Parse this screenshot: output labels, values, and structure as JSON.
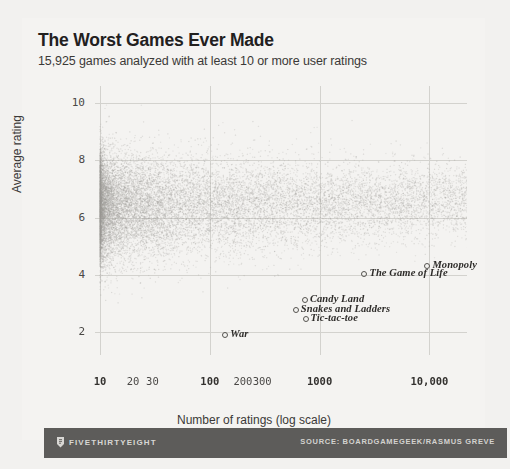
{
  "header": {
    "title": "The Worst Games Ever Made",
    "subtitle": "15,925 games analyzed with at least 10 or more user ratings"
  },
  "footer": {
    "brand": "FIVETHIRTYEIGHT",
    "source": "SOURCE: BOARDGAMEGEEK/RASMUS GREVE"
  },
  "chart_data": {
    "type": "scatter",
    "title": "The Worst Games Ever Made",
    "subtitle": "15,925 games analyzed with at least 10 or more user ratings",
    "xlabel": "Number of ratings (log scale)",
    "ylabel": "Average rating",
    "xscale": "log",
    "xlim": [
      9,
      22000
    ],
    "ylim": [
      1.2,
      10.6
    ],
    "grid": true,
    "legend": false,
    "point_count": 15925,
    "point_color": "#9a9894",
    "xticks": [
      {
        "value": 10,
        "label": "10",
        "major": true
      },
      {
        "value": 20,
        "label": "20",
        "major": false
      },
      {
        "value": 30,
        "label": "30",
        "major": false
      },
      {
        "value": 100,
        "label": "100",
        "major": true
      },
      {
        "value": 200,
        "label": "200",
        "major": false
      },
      {
        "value": 300,
        "label": "300",
        "major": false
      },
      {
        "value": 1000,
        "label": "1000",
        "major": true
      },
      {
        "value": 10000,
        "label": "10,000",
        "major": true
      }
    ],
    "yticks": [
      {
        "value": 2,
        "label": "2"
      },
      {
        "value": 4,
        "label": "4"
      },
      {
        "value": 6,
        "label": "6"
      },
      {
        "value": 8,
        "label": "8"
      },
      {
        "value": 10,
        "label": "10"
      }
    ],
    "gridlines_x": [
      10,
      100,
      1000,
      10000
    ],
    "gridlines_y": [
      2,
      4,
      6,
      8,
      10
    ],
    "cloud": {
      "description": "Dense mass of game ratings concentrated at low rating counts, median rating near 6.4, thinning toward high rating counts.",
      "seed": 1337,
      "y_center": 6.35,
      "y_spread": 0.95,
      "x_log_min": 1.0,
      "x_log_max": 4.35,
      "x_decay": 2.6
    },
    "annotations": [
      {
        "label": "Monopoly",
        "x": 9000,
        "y": 4.35
      },
      {
        "label": "The Game of Life",
        "x": 2400,
        "y": 4.05
      },
      {
        "label": "Candy Land",
        "x": 690,
        "y": 3.15
      },
      {
        "label": "Snakes and Ladders",
        "x": 570,
        "y": 2.8
      },
      {
        "label": "Tic-tac-toe",
        "x": 700,
        "y": 2.5
      },
      {
        "label": "War",
        "x": 130,
        "y": 1.95
      }
    ]
  }
}
